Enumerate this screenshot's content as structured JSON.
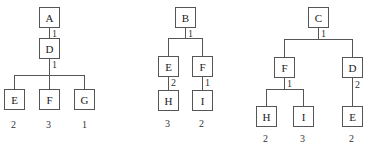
{
  "trees": [
    {
      "root": "A",
      "nodes": {
        "A": "A",
        "D": "D",
        "E": "E",
        "F": "F",
        "G": "G"
      },
      "edge_weights": {
        "A_D": "1",
        "D_children": "1"
      },
      "leaf_values": {
        "E": "2",
        "F": "3",
        "G": "1"
      }
    },
    {
      "root": "B",
      "nodes": {
        "B": "B",
        "E": "E",
        "F": "F",
        "H": "H",
        "I": "I"
      },
      "edge_weights": {
        "B_children": "1",
        "E_H": "2",
        "F_I": "1"
      },
      "leaf_values": {
        "H": "3",
        "I": "2"
      }
    },
    {
      "root": "C",
      "nodes": {
        "C": "C",
        "F": "F",
        "D": "D",
        "H": "H",
        "I": "I",
        "E": "E"
      },
      "edge_weights": {
        "C_children": "1",
        "F_children": "1",
        "D_E": "2"
      },
      "leaf_values": {
        "H": "2",
        "I": "3",
        "E": "2"
      }
    }
  ]
}
